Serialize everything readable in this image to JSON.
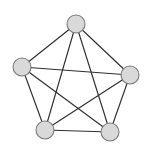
{
  "figure": {
    "background_color": "#ffffff",
    "width": 151,
    "height": 152
  },
  "chart_data": {
    "type": "diagram",
    "subtype": "node-link-graph",
    "title": "",
    "xlabel": "",
    "ylabel": "",
    "grid": false,
    "legend": null,
    "node_style": {
      "shape": "circle",
      "radius": 9,
      "fill_color": "#d9d9d9",
      "border_color": "#7a7a7a",
      "border_width": 1.1
    },
    "edge_style": {
      "color": "#2f2f2f",
      "width": 1.15,
      "directed": false
    },
    "node_count": 5,
    "edge_count": 10,
    "nodes": [
      {
        "id": "n1",
        "label": "",
        "x": 76,
        "y": 24
      },
      {
        "id": "n2",
        "label": "",
        "x": 22,
        "y": 67
      },
      {
        "id": "n3",
        "label": "",
        "x": 130,
        "y": 75
      },
      {
        "id": "n4",
        "label": "",
        "x": 45,
        "y": 130
      },
      {
        "id": "n5",
        "label": "",
        "x": 110,
        "y": 132
      }
    ],
    "edges": [
      {
        "id": "e1",
        "source": "n1",
        "target": "n2"
      },
      {
        "id": "e2",
        "source": "n1",
        "target": "n3"
      },
      {
        "id": "e3",
        "source": "n1",
        "target": "n4"
      },
      {
        "id": "e4",
        "source": "n1",
        "target": "n5"
      },
      {
        "id": "e5",
        "source": "n2",
        "target": "n3"
      },
      {
        "id": "e6",
        "source": "n2",
        "target": "n4"
      },
      {
        "id": "e7",
        "source": "n2",
        "target": "n5"
      },
      {
        "id": "e8",
        "source": "n3",
        "target": "n4"
      },
      {
        "id": "e9",
        "source": "n3",
        "target": "n5"
      },
      {
        "id": "e10",
        "source": "n4",
        "target": "n5"
      }
    ]
  }
}
